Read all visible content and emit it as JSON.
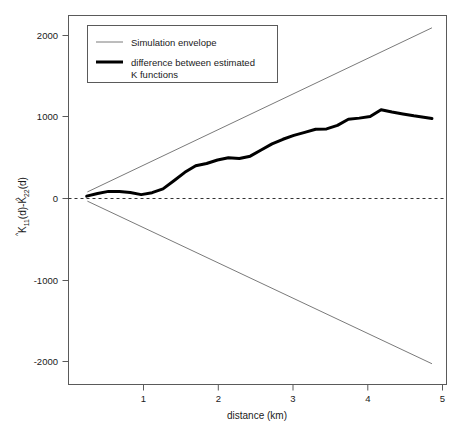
{
  "chart_data": {
    "type": "line",
    "title": "",
    "xlabel": "distance (km)",
    "ylabel": "K11(d)-K22(d)",
    "ylabel_parts": {
      "k_symbol": "K",
      "sub_11": "11",
      "arg_1": "(d)-",
      "sub_22": "22",
      "arg_2": "(d)",
      "hat_accent": "^"
    },
    "xlim": [
      0,
      5.2
    ],
    "ylim": [
      -2450,
      2350
    ],
    "xticks": [
      1,
      2,
      3,
      4,
      5
    ],
    "xtick_labels": [
      "1",
      "2",
      "3",
      "4",
      "5"
    ],
    "yticks": [
      2000,
      1000,
      0,
      -1000,
      -2000
    ],
    "ytick_labels": [
      "2000",
      "1000",
      "0",
      "-1000",
      "-2000"
    ],
    "grid": false,
    "zero_reference_line": {
      "value": 0,
      "style": "dashed",
      "color": "#333333"
    },
    "legend": {
      "position": "top-left",
      "entries": [
        {
          "label": "Simulation envelope",
          "color": "#7a7a7a",
          "linewidth": 1
        },
        {
          "label": "difference between estimated\nK functions",
          "label_line1": "difference between estimated",
          "label_line2": "K functions",
          "color": "#000000",
          "linewidth": 3
        }
      ]
    },
    "series": [
      {
        "name": "Simulation envelope upper",
        "color": "#7a7a7a",
        "linewidth": 1,
        "x": [
          0.26,
          5.0
        ],
        "values": [
          55,
          2190
        ]
      },
      {
        "name": "Simulation envelope lower",
        "color": "#7a7a7a",
        "linewidth": 1,
        "x": [
          0.26,
          5.0
        ],
        "values": [
          -65,
          -2180
        ]
      },
      {
        "name": "difference between estimated K functions",
        "color": "#000000",
        "linewidth": 3,
        "x": [
          0.25,
          0.4,
          0.55,
          0.7,
          0.85,
          1.0,
          1.15,
          1.3,
          1.45,
          1.6,
          1.75,
          1.9,
          2.05,
          2.2,
          2.35,
          2.5,
          2.65,
          2.8,
          2.95,
          3.1,
          3.25,
          3.4,
          3.55,
          3.7,
          3.85,
          4.0,
          4.15,
          4.3,
          4.45,
          4.6,
          4.75,
          5.0
        ],
        "values": [
          0,
          35,
          62,
          60,
          48,
          20,
          45,
          95,
          200,
          310,
          395,
          425,
          470,
          500,
          490,
          520,
          600,
          680,
          740,
          790,
          830,
          870,
          875,
          920,
          1000,
          1015,
          1035,
          1125,
          1095,
          1070,
          1045,
          1010
        ]
      }
    ]
  }
}
